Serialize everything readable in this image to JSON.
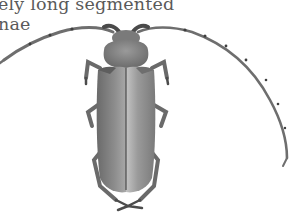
{
  "caption": {
    "lines": [
      "ely long segmented",
      "nae"
    ]
  },
  "figure": {
    "icon": "beetle-icon",
    "colors": {
      "body": "#8a8a8a",
      "body_dark": "#5c5c5c",
      "highlight": "#bdbdbd",
      "antenna": "#6e6e6e",
      "text": "#5a5a5a"
    }
  }
}
